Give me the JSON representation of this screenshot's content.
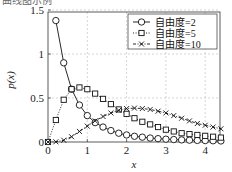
{
  "header": {
    "cut_text": "曲线图示例"
  },
  "chart_data": {
    "type": "line",
    "title": "",
    "xlabel": "x",
    "ylabel": "p(x)",
    "xlim": [
      0,
      4.4
    ],
    "ylim": [
      0,
      1.6
    ],
    "xticks": [
      0,
      1,
      2,
      3,
      4
    ],
    "yticks": [
      0,
      0.5,
      1,
      1.5
    ],
    "ytick_labels": [
      "0",
      "0.5",
      "1",
      "1.5"
    ],
    "grid": true,
    "legend_position": "upper right",
    "x": [
      0,
      0.2,
      0.4,
      0.6,
      0.8,
      1.0,
      1.2,
      1.4,
      1.6,
      1.8,
      2.0,
      2.2,
      2.4,
      2.6,
      2.8,
      3.0,
      3.2,
      3.4,
      3.6,
      3.8,
      4.0,
      4.2,
      4.4
    ],
    "series": [
      {
        "name": "自由度=2",
        "marker": "circle",
        "line": "solid",
        "values": [
          null,
          1.38,
          0.9,
          0.6,
          0.42,
          0.3,
          0.22,
          0.17,
          0.13,
          0.1,
          0.08,
          0.065,
          0.055,
          0.045,
          0.038,
          0.032,
          0.028,
          0.024,
          0.021,
          0.018,
          0.016,
          0.014,
          0.012
        ]
      },
      {
        "name": "自由度=5",
        "marker": "square",
        "line": "dotted",
        "values": [
          0,
          0.25,
          0.48,
          0.6,
          0.62,
          0.6,
          0.55,
          0.49,
          0.43,
          0.37,
          0.32,
          0.27,
          0.23,
          0.2,
          0.17,
          0.14,
          0.12,
          0.1,
          0.09,
          0.08,
          0.07,
          0.06,
          0.05
        ]
      },
      {
        "name": "自由度=10",
        "marker": "cross",
        "line": "dashdot",
        "values": [
          0,
          0.002,
          0.02,
          0.06,
          0.12,
          0.18,
          0.24,
          0.29,
          0.33,
          0.36,
          0.38,
          0.385,
          0.38,
          0.37,
          0.35,
          0.33,
          0.3,
          0.27,
          0.24,
          0.21,
          0.19,
          0.17,
          0.15
        ]
      }
    ]
  }
}
